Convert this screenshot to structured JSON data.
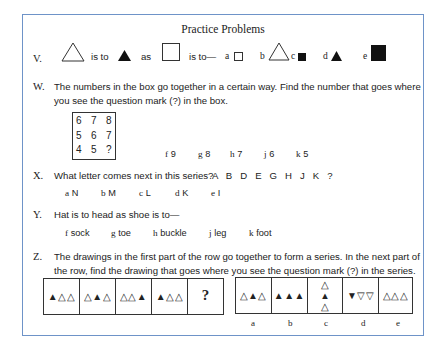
{
  "title": "Practice Problems",
  "questions": {
    "V": {
      "label": "V.",
      "is_to_1": "is to",
      "as": "as",
      "is_to_2": "is to—",
      "stem_shapes": [
        "open-triangle",
        "filled-triangle",
        "open-square"
      ],
      "options": [
        {
          "letter": "a",
          "shape": "small-open-square"
        },
        {
          "letter": "b",
          "shape": "large-open-triangle"
        },
        {
          "letter": "c",
          "shape": "small-filled-square"
        },
        {
          "letter": "d",
          "shape": "filled-triangle"
        },
        {
          "letter": "e",
          "shape": "large-filled-square"
        }
      ]
    },
    "W": {
      "label": "W.",
      "text_line1": "The numbers in the box go together in a certain way.  Find the number that goes where",
      "text_line2": "you see the question mark (?) in the box.",
      "grid": [
        [
          "6",
          "7",
          "8"
        ],
        [
          "5",
          "6",
          "7"
        ],
        [
          "4",
          "5",
          "?"
        ]
      ],
      "options": [
        {
          "letter": "f",
          "value": "9"
        },
        {
          "letter": "g",
          "value": "8"
        },
        {
          "letter": "h",
          "value": "7"
        },
        {
          "letter": "j",
          "value": "6"
        },
        {
          "letter": "k",
          "value": "5"
        }
      ]
    },
    "X": {
      "label": "X.",
      "text": "What letter comes next in this series?",
      "series": "A   B   D   E   G   H   J   K   ?",
      "options": [
        {
          "letter": "a",
          "value": "N"
        },
        {
          "letter": "b",
          "value": "M"
        },
        {
          "letter": "c",
          "value": "L"
        },
        {
          "letter": "d",
          "value": "K"
        },
        {
          "letter": "e",
          "value": "I"
        }
      ]
    },
    "Y": {
      "label": "Y.",
      "text": "Hat is to head as shoe is to—",
      "options": [
        {
          "letter": "f",
          "value": "sock"
        },
        {
          "letter": "g",
          "value": "toe"
        },
        {
          "letter": "h",
          "value": "buckle"
        },
        {
          "letter": "j",
          "value": "leg"
        },
        {
          "letter": "k",
          "value": "foot"
        }
      ]
    },
    "Z": {
      "label": "Z.",
      "text_line1": "The drawings in the first part of the row go together to form a series.  In the next part of",
      "text_line2": "the row, find the drawing that goes where you see the question mark (?) in the series.",
      "series_cells": [
        "▲△△",
        "△▲△",
        "△△▲",
        "▲△△"
      ],
      "question_mark": "?",
      "answer_cells": [
        {
          "letter": "a",
          "glyphs": "△▲△"
        },
        {
          "letter": "b",
          "glyphs": "▲▲▲"
        },
        {
          "letter": "c",
          "glyphs_vertical": [
            "△",
            "▲",
            "△"
          ]
        },
        {
          "letter": "d",
          "glyphs": "▼▽▽"
        },
        {
          "letter": "e",
          "glyphs": "△△△"
        }
      ]
    }
  },
  "colors": {
    "frame_border": "#6e93c8",
    "ink": "#222222"
  }
}
